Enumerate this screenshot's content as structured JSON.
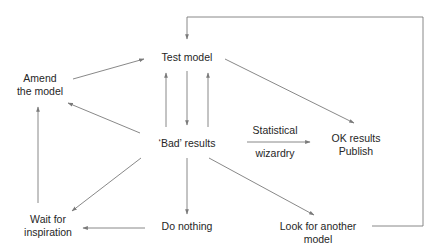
{
  "colors": {
    "line": "#7a7a7a",
    "text": "#262626",
    "background": "#ffffff"
  },
  "nodes": {
    "test_model": {
      "lines": [
        "Test model"
      ]
    },
    "amend_model": {
      "lines": [
        "Amend",
        "the model"
      ]
    },
    "bad_results": {
      "lines": [
        "‘Bad’ results"
      ]
    },
    "ok_results": {
      "lines": [
        "OK results",
        "Publish"
      ]
    },
    "wait_inspiration": {
      "lines": [
        "Wait for",
        "inspiration"
      ]
    },
    "do_nothing": {
      "lines": [
        "Do nothing"
      ]
    },
    "look_another": {
      "lines": [
        "Look for another",
        "model"
      ]
    }
  },
  "edge_labels": {
    "statistical": "Statistical",
    "wizardry": "wizardry"
  },
  "edges": [
    {
      "from": "amend_model",
      "to": "test_model"
    },
    {
      "from": "bad_results",
      "to": "test_model",
      "note": "left upward arrow"
    },
    {
      "from": "test_model",
      "to": "bad_results",
      "note": "center downward arrow"
    },
    {
      "from": "bad_results",
      "to": "test_model",
      "note": "right upward arrow"
    },
    {
      "from": "bad_results",
      "to": "amend_model"
    },
    {
      "from": "test_model",
      "to": "ok_results"
    },
    {
      "from": "bad_results",
      "to": "ok_results",
      "label": "Statistical wizardry"
    },
    {
      "from": "bad_results",
      "to": "wait_inspiration"
    },
    {
      "from": "wait_inspiration",
      "to": "amend_model"
    },
    {
      "from": "bad_results",
      "to": "do_nothing"
    },
    {
      "from": "do_nothing",
      "to": "wait_inspiration"
    },
    {
      "from": "bad_results",
      "to": "look_another"
    },
    {
      "from": "look_another",
      "to": "test_model",
      "note": "loop back via top bracket"
    }
  ]
}
